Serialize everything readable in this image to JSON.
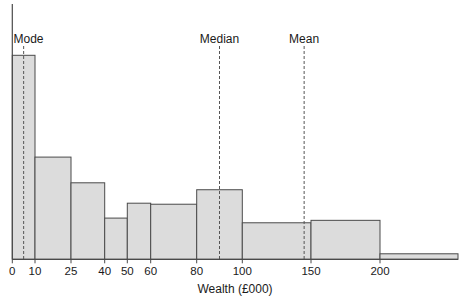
{
  "chart_data": {
    "type": "bar",
    "subtype": "histogram",
    "title": "",
    "xlabel": "Wealth (£000)",
    "ylabel": "",
    "y_axis_scale_shown": false,
    "grid": false,
    "legend": null,
    "x_tick_labels": [
      "0",
      "10",
      "25",
      "40",
      "50",
      "60",
      "80",
      "100",
      "150",
      "200"
    ],
    "bins": [
      {
        "from": 0,
        "to": 10,
        "relative_density": 100.0
      },
      {
        "from": 10,
        "to": 25,
        "relative_density": 50.1
      },
      {
        "from": 25,
        "to": 40,
        "relative_density": 37.5
      },
      {
        "from": 40,
        "to": 50,
        "relative_density": 20.2
      },
      {
        "from": 50,
        "to": 60,
        "relative_density": 27.5
      },
      {
        "from": 60,
        "to": 80,
        "relative_density": 27.0
      },
      {
        "from": 80,
        "to": 100,
        "relative_density": 34.1
      },
      {
        "from": 100,
        "to": 150,
        "relative_density": 17.9
      },
      {
        "from": 150,
        "to": 200,
        "relative_density": 19.1
      },
      {
        "from": 200,
        "to": null,
        "relative_density": 2.7
      }
    ],
    "annotations": [
      {
        "label": "Mode",
        "x": 5
      },
      {
        "label": "Median",
        "x": 90
      },
      {
        "label": "Mean",
        "x": 145
      }
    ],
    "colors": {
      "bar_fill": "#dcdcdc",
      "bar_edge": "#4a4a4a",
      "marker_line": "#555555"
    }
  }
}
